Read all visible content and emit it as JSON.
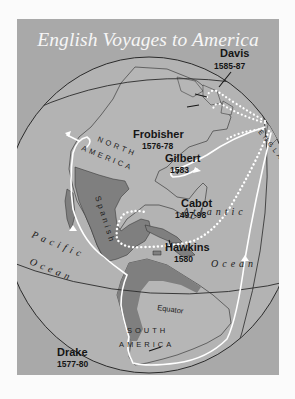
{
  "title": "English Voyages to America",
  "colors": {
    "page_background": "#fbfbfb",
    "panel_background": "#a9a9a9",
    "globe_ocean": "#b3b3b3",
    "land": "#b6b6b6",
    "spanish_territory": "#7f7f7f",
    "route": "#ffffff",
    "lines": "#2a2a2a"
  },
  "voyages": [
    {
      "name": "Davis",
      "years": "1585-87",
      "route_style": "dotted"
    },
    {
      "name": "Frobisher",
      "years": "1576-78",
      "route_style": "dotted"
    },
    {
      "name": "Gilbert",
      "years": "1583",
      "route_style": "dotted"
    },
    {
      "name": "Cabot",
      "years": "1497-98",
      "route_style": "solid"
    },
    {
      "name": "Hawkins",
      "years": "1580",
      "route_style": "dotted"
    },
    {
      "name": "Drake",
      "years": "1577-80",
      "route_style": "solid"
    }
  ],
  "regions": {
    "north_america_line1": "NORTH",
    "north_america_line2": "AMERICA",
    "south_america_line1": "SOUTH",
    "south_america_line2": "AMERICA",
    "spanish": "Spanish",
    "england": "ENGLAND"
  },
  "oceans": {
    "atlantic_1": "Atlantic",
    "atlantic_2": "Ocean",
    "pacific_1": "Pacific",
    "pacific_2": "Ocean"
  },
  "lines": {
    "equator": "Equator"
  }
}
